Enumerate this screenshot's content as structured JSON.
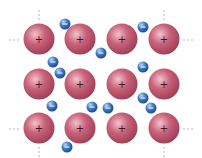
{
  "diagram": {
    "ion": {
      "label": "+",
      "charge": "positive",
      "color": "#c9627a",
      "highlight": "#f2c2cd",
      "shadow": "#9c3d55",
      "rows": 3,
      "cols": 4
    },
    "electron": {
      "label": "−",
      "charge": "negative",
      "color": "#3f7bc4",
      "highlight": "#bcd6f2",
      "shadow": "#1f4f8f",
      "count": 12
    },
    "continuation": {
      "symbol": "⋯",
      "color": "#9a9a9a",
      "directions": [
        "top",
        "bottom",
        "left",
        "right"
      ]
    }
  }
}
